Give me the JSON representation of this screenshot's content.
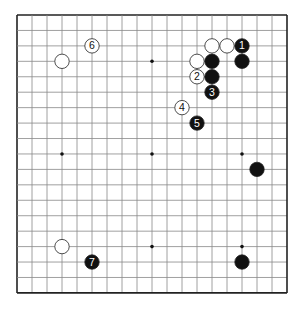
{
  "board": {
    "size": 19,
    "origin_x": 17,
    "origin_y": 15,
    "step_x": 15,
    "step_y": 15.44,
    "line_color": "#888888",
    "border_color": "#222222",
    "star_points": [
      [
        3,
        3
      ],
      [
        9,
        3
      ],
      [
        15,
        3
      ],
      [
        3,
        9
      ],
      [
        9,
        9
      ],
      [
        15,
        9
      ],
      [
        3,
        15
      ],
      [
        9,
        15
      ],
      [
        15,
        15
      ]
    ]
  },
  "stones": [
    {
      "color": "black",
      "col": 15,
      "row": 2,
      "label": "1"
    },
    {
      "color": "black",
      "col": 15,
      "row": 3,
      "label": ""
    },
    {
      "color": "white",
      "col": 13,
      "row": 2,
      "label": ""
    },
    {
      "color": "white",
      "col": 14,
      "row": 2,
      "label": ""
    },
    {
      "color": "white",
      "col": 12,
      "row": 3,
      "label": ""
    },
    {
      "color": "black",
      "col": 13,
      "row": 3,
      "label": ""
    },
    {
      "color": "white",
      "col": 12,
      "row": 4,
      "label": "2"
    },
    {
      "color": "black",
      "col": 13,
      "row": 4,
      "label": ""
    },
    {
      "color": "black",
      "col": 13,
      "row": 5,
      "label": "3"
    },
    {
      "color": "white",
      "col": 11,
      "row": 6,
      "label": "4"
    },
    {
      "color": "black",
      "col": 12,
      "row": 7,
      "label": "5"
    },
    {
      "color": "white",
      "col": 5,
      "row": 2,
      "label": "6"
    },
    {
      "color": "white",
      "col": 3,
      "row": 3,
      "label": ""
    },
    {
      "color": "black",
      "col": 16,
      "row": 10,
      "label": ""
    },
    {
      "color": "white",
      "col": 3,
      "row": 15,
      "label": ""
    },
    {
      "color": "black",
      "col": 5,
      "row": 16,
      "label": "7"
    },
    {
      "color": "black",
      "col": 15,
      "row": 16,
      "label": ""
    }
  ]
}
